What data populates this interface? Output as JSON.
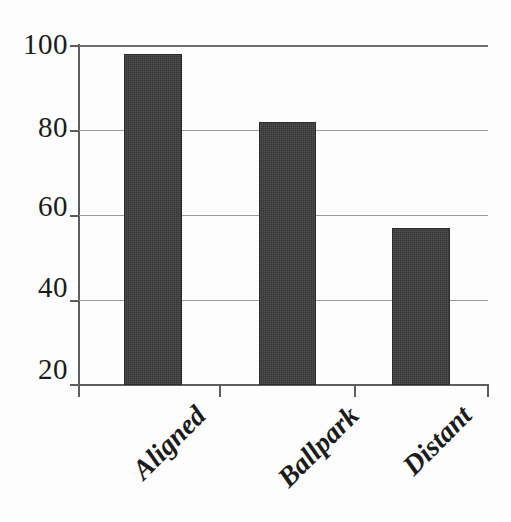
{
  "chart_data": {
    "type": "bar",
    "title": "",
    "subtitle": "",
    "xlabel": "",
    "ylabel": "",
    "categories": [
      "Aligned",
      "Ballpark",
      "Distant"
    ],
    "values": [
      98,
      82,
      57
    ],
    "series": [
      {
        "name": "",
        "values": [
          98,
          82,
          57
        ]
      }
    ],
    "ylim": [
      20,
      100
    ],
    "yticks": [
      20,
      40,
      60,
      80,
      100
    ],
    "ytick_labels": [
      "20",
      "40",
      "60",
      "80",
      "100"
    ],
    "grid": true,
    "grid_axis": "y",
    "legend": false,
    "legend_position": "none",
    "bar_color": "#3b3b3b",
    "grid_color": "#9a9a9a",
    "axis_color": "#5d5d5d",
    "background_color": "#fdfdfd",
    "tick_label_color": "#1b1b1b",
    "xtick_label_rotation": -45
  }
}
